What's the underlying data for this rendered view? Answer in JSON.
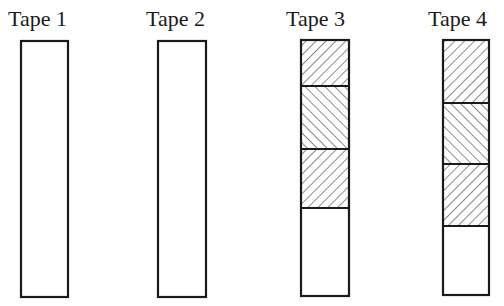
{
  "diagram": {
    "tapes": [
      {
        "label": "Tape 1",
        "x": 21,
        "width": 47,
        "top": 41,
        "bottom": 297,
        "segments": []
      },
      {
        "label": "Tape 2",
        "x": 158,
        "width": 48,
        "top": 41,
        "bottom": 297,
        "segments": []
      },
      {
        "label": "Tape 3",
        "x": 301,
        "width": 48,
        "top": 40,
        "bottom": 296,
        "segments": [
          {
            "from": 40,
            "to": 86,
            "hatch": "forward"
          },
          {
            "from": 86,
            "to": 149,
            "hatch": "backward"
          },
          {
            "from": 149,
            "to": 208,
            "hatch": "forward"
          }
        ]
      },
      {
        "label": "Tape 4",
        "x": 443,
        "width": 46,
        "top": 40,
        "bottom": 295,
        "segments": [
          {
            "from": 40,
            "to": 103,
            "hatch": "forward"
          },
          {
            "from": 103,
            "to": 164,
            "hatch": "backward"
          },
          {
            "from": 164,
            "to": 226,
            "hatch": "forward"
          }
        ]
      }
    ],
    "colors": {
      "stroke": "#1a1a1a",
      "background": "#ffffff"
    }
  }
}
